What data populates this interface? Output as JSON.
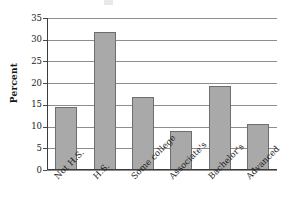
{
  "chart_data": {
    "type": "bar",
    "title": "",
    "xlabel": "",
    "ylabel": "Percent",
    "categories": [
      "Not H.S.",
      "H.S.",
      "Some college",
      "Associate's",
      "Bachelor's",
      "Advanced"
    ],
    "values": [
      14.5,
      31.8,
      16.8,
      9.0,
      19.3,
      10.5
    ],
    "ylim": [
      0,
      35
    ],
    "y_ticks": [
      0,
      5,
      10,
      15,
      20,
      25,
      30,
      35
    ],
    "y_tick_labels": [
      "0",
      "5",
      "10",
      "15",
      "20",
      "25",
      "30",
      "35"
    ],
    "grid": true,
    "legend": false,
    "legend_position": "none",
    "bar_fill_color": "#a9a9a9",
    "bar_border_color": "#6e6e6e",
    "gridline_color": "#8d8d8d",
    "axis_color": "#3c3c3c",
    "text_color": "#1a1a1a",
    "x_tick_label_rotation": -45
  }
}
